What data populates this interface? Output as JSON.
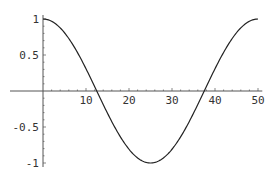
{
  "chart_data": {
    "type": "line",
    "title": "",
    "xlabel": "",
    "ylabel": "",
    "function": "cos(2*pi*x/50)",
    "xlim": [
      0,
      51
    ],
    "ylim": [
      -1,
      1
    ],
    "grid": false,
    "legend": null,
    "x_ticks": [
      10,
      20,
      30,
      40,
      50
    ],
    "x_tick_labels": [
      "10",
      "20",
      "30",
      "40",
      "50"
    ],
    "y_ticks": [
      1,
      0.5,
      -0.5,
      -1
    ],
    "y_tick_labels": [
      "1",
      "0.5",
      "-0.5",
      "-1"
    ],
    "series": [
      {
        "name": "curve",
        "color": "#222222",
        "x": [
          0,
          5,
          10,
          12.5,
          15,
          20,
          25,
          30,
          35,
          37.5,
          40,
          45,
          50
        ],
        "y": [
          1,
          0.809,
          0.309,
          0,
          -0.309,
          -0.809,
          -1,
          -0.809,
          -0.309,
          0,
          0.309,
          0.809,
          1
        ]
      }
    ]
  }
}
